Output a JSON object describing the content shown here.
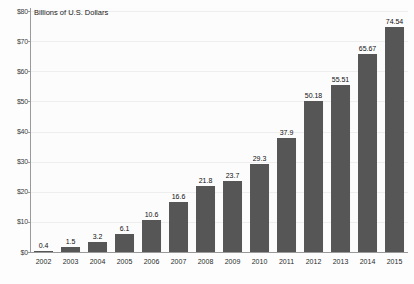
{
  "chart_data": {
    "type": "bar",
    "title": "Billions of U.S. Dollars",
    "xlabel": "",
    "ylabel": "",
    "categories": [
      "2002",
      "2003",
      "2004",
      "2005",
      "2006",
      "2007",
      "2008",
      "2009",
      "2010",
      "2011",
      "2012",
      "2013",
      "2014",
      "2015"
    ],
    "values": [
      0.4,
      1.5,
      3.2,
      6.1,
      10.6,
      16.6,
      21.8,
      23.7,
      29.3,
      37.9,
      50.18,
      55.51,
      65.67,
      74.54
    ],
    "value_labels": [
      "0.4",
      "1.5",
      "3.2",
      "6.1",
      "10.6",
      "16.6",
      "21.8",
      "23.7",
      "29.3",
      "37.9",
      "50.18",
      "55.51",
      "65.67",
      "74.54"
    ],
    "ylim": [
      0,
      80
    ],
    "y_ticks": [
      0,
      10,
      20,
      30,
      40,
      50,
      60,
      70,
      80
    ],
    "y_tick_labels": [
      "$0",
      "$10",
      "$20",
      "$30",
      "$40",
      "$50",
      "$60",
      "$70",
      "$80"
    ],
    "grid": true,
    "legend": "none",
    "series_color": "#565656"
  }
}
